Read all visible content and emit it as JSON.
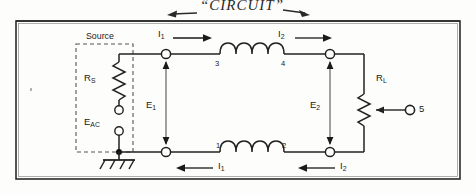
{
  "figure": {
    "annotation_handwritten": "“CIRCUIT”",
    "annotation_left_arrow": "←",
    "annotation_right_arrow": "→"
  },
  "source_block": {
    "title": "Source",
    "series_resistor": "R",
    "series_resistor_sub": "S",
    "generator": "E",
    "generator_sub": "AC"
  },
  "load": {
    "label": "R",
    "label_sub": "L",
    "wiper_terminal": "5"
  },
  "currents": [
    {
      "label": "I",
      "sub": "1",
      "location": "top-left",
      "direction": "right"
    },
    {
      "label": "I",
      "sub": "2",
      "location": "top-right",
      "direction": "right"
    },
    {
      "label": "I",
      "sub": "1",
      "location": "bottom-left",
      "direction": "left"
    },
    {
      "label": "I",
      "sub": "2",
      "location": "bottom-right",
      "direction": "left"
    }
  ],
  "voltages": [
    {
      "label": "E",
      "sub": "1",
      "location": "left"
    },
    {
      "label": "E",
      "sub": "2",
      "location": "right"
    }
  ],
  "terminals": {
    "top_inductor_left": "3",
    "top_inductor_right": "4",
    "bottom_inductor_left": "1",
    "bottom_inductor_right": "2"
  },
  "icons": {
    "ground": "ground-symbol",
    "inductor_top": "inductor-coil-icon",
    "inductor_bottom": "inductor-coil-icon",
    "resistor_source": "resistor-zigzag-icon",
    "resistor_load": "potentiometer-icon"
  },
  "colors": {
    "ink": "#1a1a1a",
    "wire": "#222222",
    "paper": "#fdfdfc",
    "dashed": "#555555"
  }
}
